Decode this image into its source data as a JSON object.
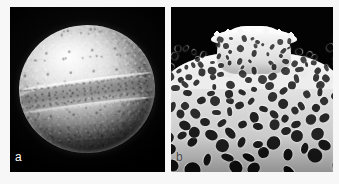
{
  "figure": {
    "background_color": "#f7f7f8",
    "panel_count": 2
  },
  "panels": [
    {
      "id": "a",
      "label": "a",
      "label_color": "#ffffff",
      "background_color": "#050505",
      "subject": "pollen-grain-whole",
      "description": "Scanning electron micrograph of a whole spheroidal pollen grain in equatorial view showing a prominent encircling colpus furrow",
      "features": [
        "spheroidal-body",
        "equatorial-colpus-furrow",
        "granular-exine-texture",
        "specular-highlight-upper-left"
      ]
    },
    {
      "id": "b",
      "label": "b",
      "label_color": "#4a4a4a",
      "background_color": "#030303",
      "subject": "exine-surface-detail",
      "description": "High magnification detail of the perforate exine surface with a protruding crest or annulus rising above the undulating surface",
      "features": [
        "perforate-reticulate-surface",
        "lumina-pores",
        "protruding-crest",
        "flaring-crest-lip"
      ]
    }
  ]
}
